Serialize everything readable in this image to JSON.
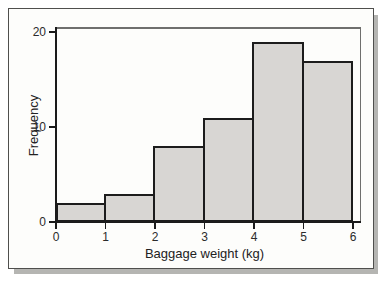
{
  "figure": {
    "kind": "scanned textbook histogram",
    "xlabel": "Baggage weight (kg)",
    "ylabel": "Frequency"
  },
  "chart_data": {
    "type": "bar",
    "subtype": "histogram",
    "title": "",
    "xlabel": "Baggage weight (kg)",
    "ylabel": "Frequency",
    "bin_edges": [
      0,
      1,
      2,
      3,
      4,
      5,
      6
    ],
    "categories": [
      "0-1",
      "1-2",
      "2-3",
      "3-4",
      "4-5",
      "5-6"
    ],
    "values": [
      2,
      3,
      8,
      11,
      19,
      17
    ],
    "x_ticks": [
      "0",
      "1",
      "2",
      "3",
      "4",
      "5",
      "6"
    ],
    "y_ticks": [
      "0",
      "10",
      "20"
    ],
    "y_tick_values": [
      0,
      10,
      20
    ],
    "xlim": [
      0,
      6
    ],
    "ylim": [
      0,
      20.5
    ],
    "grid": false,
    "legend": false,
    "bar_fill": "#d8d6d3",
    "bar_border": "#1c1c1c",
    "axis_color": "#1a1a1a",
    "frame_color": "#6f6f6d"
  }
}
